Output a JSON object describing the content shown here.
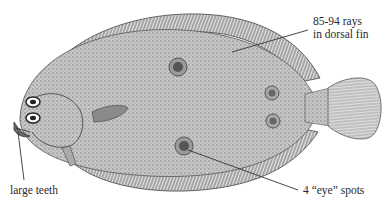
{
  "figure": {
    "colors": {
      "ink": "#2a2a2a",
      "body_fill": "#bdbdbd",
      "fin_fill": "#cfcfcf",
      "background": "#ffffff"
    },
    "annotations": [
      {
        "id": "dorsal",
        "lines": [
          "85-94 rays",
          "in dorsal fin"
        ]
      },
      {
        "id": "teeth",
        "lines": [
          "large teeth"
        ]
      },
      {
        "id": "eyespots",
        "lines": [
          "4 “eye” spots"
        ]
      }
    ]
  }
}
